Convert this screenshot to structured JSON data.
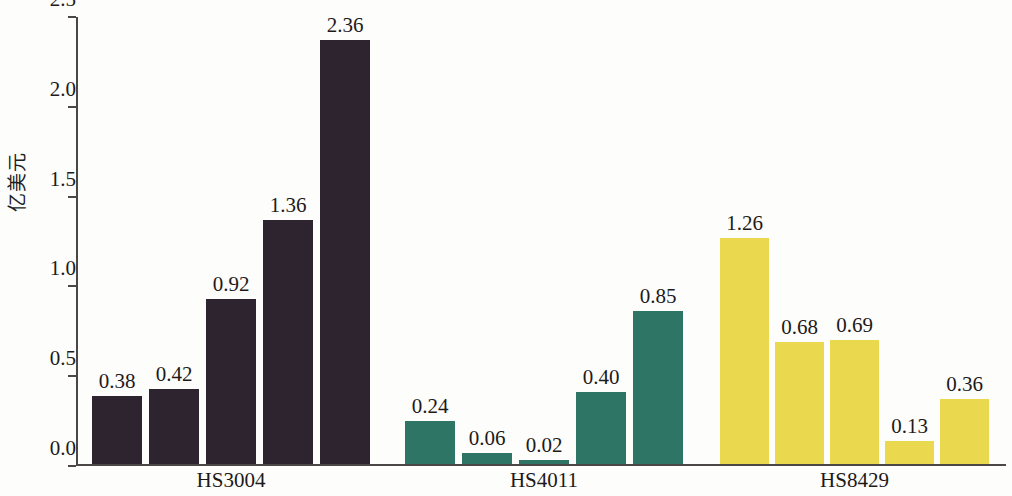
{
  "chart_data": {
    "type": "bar",
    "title": "",
    "subtitle": "",
    "xlabel": "",
    "ylabel": "亿美元",
    "ylim": [
      0.0,
      2.5
    ],
    "ytick_labels": [
      "0.0",
      "0.5",
      "1.0",
      "1.5",
      "2.0",
      "2.5"
    ],
    "ytick_values": [
      0.0,
      0.5,
      1.0,
      1.5,
      2.0,
      2.5
    ],
    "grid": false,
    "legend": "none",
    "categories": [
      "HS3004",
      "HS4011",
      "HS8429"
    ],
    "groups": [
      {
        "label": "HS3004",
        "color": "#2e2430",
        "values": [
          0.38,
          0.42,
          0.92,
          1.36,
          2.36
        ],
        "value_labels": [
          "0.38",
          "0.42",
          "0.92",
          "1.36",
          "2.36"
        ]
      },
      {
        "label": "HS4011",
        "color": "#2f7566",
        "values": [
          0.24,
          0.06,
          0.02,
          0.4,
          0.85
        ],
        "value_labels": [
          "0.24",
          "0.06",
          "0.02",
          "0.40",
          "0.85"
        ]
      },
      {
        "label": "HS8429",
        "color": "#ead94e",
        "values": [
          1.26,
          0.68,
          0.69,
          0.13,
          0.36
        ],
        "value_labels": [
          "1.26",
          "0.68",
          "0.69",
          "0.13",
          "0.36"
        ]
      }
    ]
  },
  "axis": {
    "y_title": "亿美元",
    "tick_0": "0.0",
    "tick_1": "0.5",
    "tick_2": "1.0",
    "tick_3": "1.5",
    "tick_4": "2.0",
    "tick_5": "2.5"
  },
  "labels": {
    "group_0": "HS3004",
    "group_1": "HS4011",
    "group_2": "HS8429"
  },
  "colors": {
    "dark": "#2e2430",
    "teal": "#2f7566",
    "yellow": "#ead94e",
    "axis": "#4b4744",
    "text": "#1d1a19",
    "background": "#fdfdfc"
  }
}
